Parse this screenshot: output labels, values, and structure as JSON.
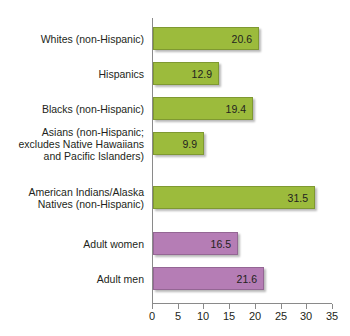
{
  "chart_data": {
    "type": "bar",
    "orientation": "horizontal",
    "title": "",
    "xlabel": "",
    "ylabel": "",
    "xlim": [
      0,
      35
    ],
    "xticks": [
      0,
      5,
      10,
      15,
      20,
      25,
      30,
      35
    ],
    "grid": false,
    "legend": "none",
    "colors": {
      "group_race": "#9cbb3c",
      "group_sex": "#b57db5",
      "axis": "#8a8a8a",
      "text": "#231f20",
      "background": "#ffffff"
    },
    "categories": [
      "Whites (non-Hispanic)",
      "Hispanics",
      "Blacks (non-Hispanic)",
      "Asians (non-Hispanic; excludes Native Hawaiians and Pacific Islanders)",
      "American Indians/Alaska Natives (non-Hispanic)",
      "Adult women",
      "Adult men"
    ],
    "values": [
      20.6,
      12.9,
      19.4,
      9.9,
      31.5,
      16.5,
      21.6
    ],
    "bars": [
      {
        "label_lines": [
          "Whites (non-Hispanic)"
        ],
        "value": 20.6,
        "value_text": "20.6",
        "color_group": "green"
      },
      {
        "label_lines": [
          "Hispanics"
        ],
        "value": 12.9,
        "value_text": "12.9",
        "color_group": "green"
      },
      {
        "label_lines": [
          "Blacks (non-Hispanic)"
        ],
        "value": 19.4,
        "value_text": "19.4",
        "color_group": "green"
      },
      {
        "label_lines": [
          "Asians (non-Hispanic;",
          "excludes Native Hawaiians",
          "and Pacific Islanders)"
        ],
        "value": 9.9,
        "value_text": "9.9",
        "color_group": "green"
      },
      {
        "label_lines": [
          "American Indians/Alaska",
          "Natives (non-Hispanic)"
        ],
        "value": 31.5,
        "value_text": "31.5",
        "color_group": "green"
      },
      {
        "label_lines": [
          "Adult women"
        ],
        "value": 16.5,
        "value_text": "16.5",
        "color_group": "purple"
      },
      {
        "label_lines": [
          "Adult men"
        ],
        "value": 21.6,
        "value_text": "21.6",
        "color_group": "purple"
      }
    ],
    "tick_labels": [
      "0",
      "5",
      "10",
      "15",
      "20",
      "25",
      "30",
      "35"
    ]
  }
}
